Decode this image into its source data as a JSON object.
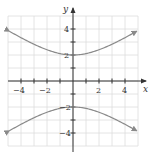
{
  "chart_data": {
    "type": "line",
    "title": "",
    "xlabel": "x",
    "ylabel": "y",
    "xlim": [
      -5,
      5
    ],
    "ylim": [
      -5,
      5
    ],
    "grid": true,
    "x_ticks": [
      -4,
      -3,
      -2,
      -1,
      1,
      2,
      3,
      4
    ],
    "y_ticks": [
      -4,
      -3,
      -2,
      -1,
      1,
      2,
      3,
      4
    ],
    "x_tick_labels": [
      "-4",
      "-2",
      "2",
      "4"
    ],
    "y_tick_labels": [
      "4",
      "2",
      "-2",
      "-4"
    ],
    "equation": "y^2/4 - x^2/9 = 1",
    "series": [
      {
        "name": "upper branch",
        "x": [
          -4.9,
          -4,
          -3,
          -2,
          -1,
          0,
          1,
          2,
          3,
          4,
          4.9
        ],
        "y": [
          3.83,
          3.33,
          2.83,
          2.4,
          2.11,
          2.0,
          2.11,
          2.4,
          2.83,
          3.33,
          3.83
        ],
        "arrows": "both ends"
      },
      {
        "name": "lower branch",
        "x": [
          -4.9,
          -4,
          -3,
          -2,
          -1,
          0,
          1,
          2,
          3,
          4,
          4.9
        ],
        "y": [
          -3.83,
          -3.33,
          -2.83,
          -2.4,
          -2.11,
          -2.0,
          -2.11,
          -2.4,
          -2.83,
          -3.33,
          -3.83
        ],
        "arrows": "both ends"
      }
    ]
  },
  "colors": {
    "grid": "#dddddd",
    "axis": "#333333",
    "curve": "#8a8a8a"
  },
  "labels": {
    "x_axis": "x",
    "y_axis": "y",
    "x_neg4": "−4",
    "x_neg2": "−2",
    "x_pos2": "2",
    "x_pos4": "4",
    "y_pos4": "4",
    "y_pos2": "2",
    "y_neg2": "−2",
    "y_neg4": "−4"
  }
}
